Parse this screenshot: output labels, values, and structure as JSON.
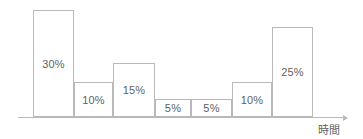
{
  "chart_data": {
    "type": "bar",
    "title": "",
    "subtitle": "",
    "xlabel": "時間",
    "ylabel": "",
    "grid": false,
    "legend": null,
    "axis_style": "single-arrow-x-axis-only",
    "bar_style": "outlined-adjacent-histogram",
    "categories": [
      "1",
      "2",
      "3",
      "4",
      "5",
      "6",
      "7"
    ],
    "values": [
      30,
      10,
      15,
      5,
      5,
      10,
      25
    ],
    "value_labels": [
      "30%",
      "10%",
      "15%",
      "5%",
      "5%",
      "10%",
      "25%"
    ],
    "unit": "%",
    "ylim": [
      0,
      30
    ],
    "bars": [
      {
        "label": "30%",
        "value": 30,
        "x": 33,
        "width": 41,
        "height": 107
      },
      {
        "label": "10%",
        "value": 10,
        "x": 74,
        "width": 39,
        "height": 35
      },
      {
        "label": "15%",
        "value": 15,
        "x": 113,
        "width": 42,
        "height": 54
      },
      {
        "label": "5%",
        "value": 5,
        "x": 155,
        "width": 36,
        "height": 18
      },
      {
        "label": "5%",
        "value": 5,
        "x": 191,
        "width": 41,
        "height": 18
      },
      {
        "label": "10%",
        "value": 10,
        "x": 232,
        "width": 40,
        "height": 35
      },
      {
        "label": "25%",
        "value": 25,
        "x": 272,
        "width": 41,
        "height": 90
      }
    ]
  },
  "colors": {
    "bar_border": "#b9b9b9",
    "bar_fill": "transparent",
    "text": "#5f5f5f",
    "axis": "#b9b9b9",
    "background": "#ffffff"
  },
  "axis": {
    "baseline_y": 117,
    "x_start": 18,
    "x_end": 343,
    "label": "時間",
    "label_x": 318,
    "label_y": 124
  }
}
